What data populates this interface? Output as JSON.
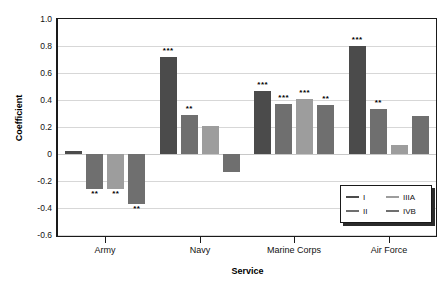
{
  "chart_data": {
    "type": "bar",
    "title": "",
    "xlabel": "Service",
    "ylabel": "Coefficient",
    "categories": [
      "Army",
      "Navy",
      "Marine Corps",
      "Air Force"
    ],
    "ylim": [
      -0.6,
      1.0
    ],
    "yticks": [
      1.0,
      0.8,
      0.6,
      0.4,
      0.2,
      0,
      -0.2,
      -0.4,
      -0.6
    ],
    "ytick_labels": [
      "1.0",
      "0.8",
      "0.6",
      "0.4",
      "0.2",
      "0",
      "-0.2",
      "-0.4",
      "-0.6"
    ],
    "grid": true,
    "legend_position": "bottom-right",
    "series": [
      {
        "name": "I",
        "color": "#4b4b4b",
        "values": [
          0.02,
          0.72,
          0.47,
          0.8
        ],
        "annotations": [
          "",
          "***",
          "***",
          "***"
        ]
      },
      {
        "name": "II",
        "color": "#6f6f6f",
        "values": [
          -0.26,
          0.29,
          0.37,
          0.33
        ],
        "annotations": [
          "**",
          "**",
          "***",
          "**"
        ]
      },
      {
        "name": "IIIA",
        "color": "#9d9d9d",
        "values": [
          -0.26,
          0.21,
          0.41,
          0.07
        ],
        "annotations": [
          "**",
          "",
          "***",
          ""
        ]
      },
      {
        "name": "IVB",
        "color": "#6f6f6f",
        "values": [
          -0.37,
          -0.13,
          0.36,
          0.28
        ],
        "annotations": [
          "**",
          "",
          "**",
          ""
        ]
      }
    ]
  },
  "legend": {
    "entries": [
      {
        "label": "I",
        "color": "#4b4b4b"
      },
      {
        "label": "IIIA",
        "color": "#9d9d9d"
      },
      {
        "label": "II",
        "color": "#6f6f6f"
      },
      {
        "label": "IVB",
        "color": "#6f6f6f"
      }
    ]
  }
}
